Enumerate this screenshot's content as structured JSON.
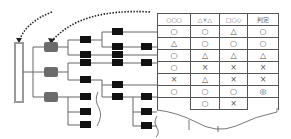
{
  "diagram": {
    "colors": {
      "root_bar": "#9a9a9a",
      "level1_box": "#6b6b6b",
      "leaf_box": "#111111",
      "lines": "#666666",
      "dotted_arrow": "#222222"
    },
    "table": {
      "headers": [
        "○○○",
        "△×△",
        "□○◇",
        "判定"
      ],
      "rows": [
        [
          "○",
          "○",
          "△",
          "○"
        ],
        [
          "△",
          "○",
          "○",
          "○"
        ],
        [
          "○",
          "△",
          "△",
          "△"
        ],
        [
          "○",
          "×",
          "×",
          "×"
        ],
        [
          "×",
          "△",
          "×",
          "×"
        ],
        [
          "○",
          "○",
          "○",
          "◎"
        ],
        [
          "",
          "○",
          "×",
          ""
        ]
      ]
    }
  }
}
